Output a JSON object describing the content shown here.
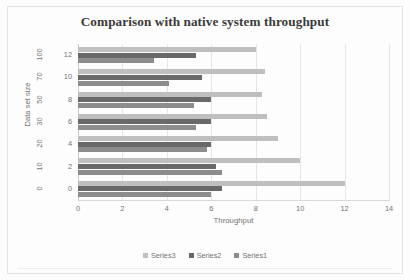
{
  "chart_data": {
    "type": "bar",
    "orientation": "horizontal",
    "title": "Comparison with native system throughput",
    "xlabel": "Throughput",
    "ylabel": "Data set size",
    "categories": [
      "0",
      "2",
      "4",
      "6",
      "8",
      "10",
      "12"
    ],
    "category_outer_labels": [
      "0",
      "10",
      "20",
      "30",
      "50",
      "70",
      "100"
    ],
    "xlim": [
      0,
      14
    ],
    "xticks": [
      "0",
      "2",
      "4",
      "6",
      "8",
      "10",
      "12",
      "14"
    ],
    "grid": "vertical",
    "legend_position": "bottom",
    "series": [
      {
        "name": "Series3",
        "color": "#bfbfbf",
        "values": [
          12.0,
          10.0,
          9.0,
          8.5,
          8.3,
          8.4,
          8.0
        ]
      },
      {
        "name": "Series2",
        "color": "#696969",
        "values": [
          6.5,
          6.2,
          6.0,
          6.0,
          6.0,
          5.6,
          5.3
        ]
      },
      {
        "name": "Series1",
        "color": "#8c8c8c",
        "values": [
          6.0,
          6.5,
          5.8,
          5.3,
          5.2,
          4.1,
          3.4
        ]
      }
    ]
  },
  "legend": {
    "items": [
      {
        "label": "Series3",
        "color": "#bfbfbf"
      },
      {
        "label": "Series2",
        "color": "#696969"
      },
      {
        "label": "Series1",
        "color": "#8c8c8c"
      }
    ]
  }
}
